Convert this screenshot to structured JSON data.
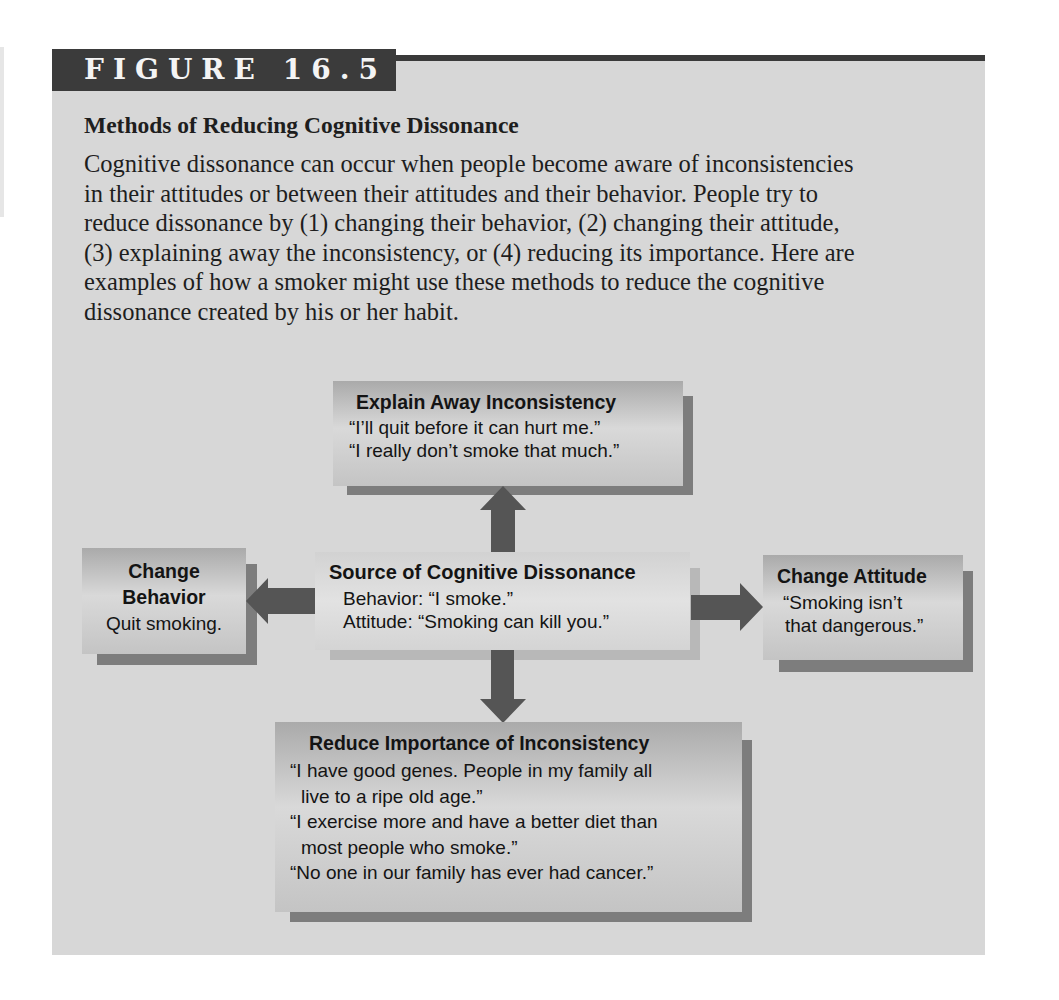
{
  "figure": {
    "label": "FIGURE 16.5",
    "title": "Methods of Reducing Cognitive Dissonance",
    "caption_lines": [
      "Cognitive dissonance can occur when people become aware of inconsistencies",
      "in their attitudes or between their attitudes and their behavior. People try to",
      "reduce dissonance by (1) changing their behavior, (2) changing their attitude,",
      "(3) explaining away the inconsistency, or (4) reducing its importance. Here are",
      "examples of how a smoker might use these methods to reduce the cognitive",
      "dissonance created by his or her habit."
    ]
  },
  "diagram": {
    "center": {
      "title": "Source of Cognitive Dissonance",
      "lines": [
        "Behavior: “I smoke.”",
        "Attitude: “Smoking can kill you.”"
      ]
    },
    "top": {
      "title": "Explain Away Inconsistency",
      "lines": [
        "“I’ll quit before it can hurt me.”",
        "“I really don’t smoke that much.”"
      ]
    },
    "left": {
      "title_lines": [
        "Change",
        "Behavior"
      ],
      "lines": [
        "Quit smoking."
      ]
    },
    "right": {
      "title": "Change Attitude",
      "lines": [
        "“Smoking isn’t",
        "that dangerous.”"
      ]
    },
    "bottom": {
      "title": "Reduce Importance of Inconsistency",
      "lines": [
        "“I have good genes. People in my family all",
        "live to a ripe old age.”",
        "“I exercise more and have a better diet than",
        "most people who smoke.”",
        "“No one in our family has ever had cancer.”"
      ]
    },
    "edges": [
      {
        "from": "center",
        "to": "top",
        "direction": "up"
      },
      {
        "from": "center",
        "to": "left",
        "direction": "left"
      },
      {
        "from": "center",
        "to": "right",
        "direction": "right"
      },
      {
        "from": "center",
        "to": "bottom",
        "direction": "down"
      }
    ],
    "colors": {
      "panel": "#d7d7d7",
      "header": "#3b3b3b",
      "arrow": "#555555",
      "shadow": "#7d7d7d"
    }
  }
}
